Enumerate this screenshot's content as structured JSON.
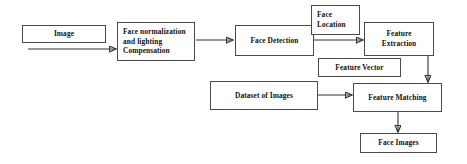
{
  "diagram": {
    "canvas": {
      "width": 467,
      "height": 164
    },
    "style": {
      "background": "#ffffff",
      "box_border": "#4a4a4a",
      "text_color": "#111111",
      "arrow_color": "#333333"
    },
    "nodes": [
      {
        "id": "image",
        "label": "Image",
        "x": 22,
        "y": 25,
        "w": 84,
        "h": 18,
        "align": "center"
      },
      {
        "id": "face_normalization",
        "label": "Face normalization\nand lighting\nCompensation",
        "x": 117,
        "y": 22,
        "w": 78,
        "h": 39,
        "align": "left"
      },
      {
        "id": "face_detection",
        "label": "Face Detection",
        "x": 235,
        "y": 25,
        "w": 79,
        "h": 31,
        "align": "center"
      },
      {
        "id": "face_location",
        "label": "Face\nLocation",
        "x": 311,
        "y": 5,
        "w": 49,
        "h": 30,
        "align": "left"
      },
      {
        "id": "feature_extraction",
        "label": "Feature\nExtraction",
        "x": 364,
        "y": 22,
        "w": 70,
        "h": 34,
        "align": "center"
      },
      {
        "id": "feature_vector",
        "label": "Feature Vector",
        "x": 318,
        "y": 58,
        "w": 83,
        "h": 19,
        "align": "center"
      },
      {
        "id": "dataset_of_images",
        "label": "Dataset of Images",
        "x": 210,
        "y": 81,
        "w": 108,
        "h": 29,
        "align": "center"
      },
      {
        "id": "feature_matching",
        "label": "Feature Matching",
        "x": 353,
        "y": 83,
        "w": 89,
        "h": 29,
        "align": "center"
      },
      {
        "id": "face_images",
        "label": "Face Images",
        "x": 360,
        "y": 133,
        "w": 77,
        "h": 20,
        "align": "center"
      }
    ],
    "edges": [
      {
        "id": "image-to-normalization",
        "from": "image",
        "to": "face_normalization",
        "kind": "arrow-right",
        "x1": 28,
        "y1": 49,
        "x2": 116,
        "y2": 49
      },
      {
        "id": "normalization-to-detection",
        "from": "face_normalization",
        "to": "face_detection",
        "kind": "arrow-right",
        "x1": 196,
        "y1": 40,
        "x2": 233,
        "y2": 40
      },
      {
        "id": "detection-to-extraction",
        "from": "face_detection",
        "to": "feature_extraction",
        "kind": "arrow-right",
        "x1": 314,
        "y1": 40,
        "x2": 363,
        "y2": 40
      },
      {
        "id": "extraction-to-matching",
        "from": "feature_extraction",
        "to": "feature_matching",
        "kind": "arrow-down",
        "x1": 428,
        "y1": 56,
        "x2": 428,
        "y2": 82
      },
      {
        "id": "dataset-to-matching",
        "from": "dataset_of_images",
        "to": "feature_matching",
        "kind": "arrow-right",
        "x1": 318,
        "y1": 95,
        "x2": 352,
        "y2": 95
      },
      {
        "id": "matching-to-face-images",
        "from": "feature_matching",
        "to": "face_images",
        "kind": "arrow-down",
        "x1": 398,
        "y1": 112,
        "x2": 398,
        "y2": 132
      }
    ]
  }
}
